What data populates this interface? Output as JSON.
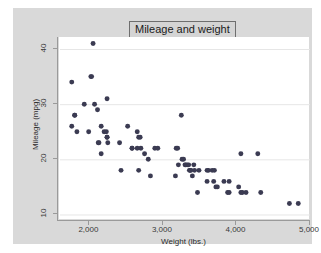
{
  "graph": {
    "title": "Mileage and weight",
    "colors": {
      "graph_region_bg": "#d9d9d9",
      "plot_bg": "#ffffff",
      "marker": "#3b3b52",
      "gridline": "#e6e6e6",
      "axis": "#9a9a9a",
      "title_box_bg": "#d4d4d4",
      "title_box_border": "#6e6e6e"
    }
  },
  "chart_data": {
    "type": "scatter",
    "title": "Mileage and weight",
    "xlabel": "Weight (lbs.)",
    "ylabel": "Mileage (mpg)",
    "xlim": [
      1600,
      5000
    ],
    "ylim": [
      9,
      42
    ],
    "xticks": [
      2000,
      3000,
      4000,
      5000
    ],
    "xticklabels": [
      "2,000",
      "3,000",
      "4,000",
      "5,000"
    ],
    "yticks": [
      10,
      20,
      30,
      40
    ],
    "yticklabels": [
      "10",
      "20",
      "30",
      "40"
    ],
    "grid": "horizontal",
    "legend": null,
    "marker": "circle",
    "marker_size": 3,
    "series": [
      {
        "name": "cars",
        "x": [
          2050,
          1760,
          2020,
          2030,
          1930,
          2240,
          2110,
          1800,
          1800,
          1760,
          1830,
          1990,
          2070,
          2160,
          2200,
          2230,
          2240,
          2250,
          2410,
          2520,
          2580,
          2650,
          2670,
          2690,
          2700,
          2120,
          2130,
          2160,
          2240,
          2430,
          2580,
          2650,
          2670,
          2750,
          2800,
          2830,
          2890,
          2930,
          3170,
          3180,
          3200,
          3210,
          3250,
          3260,
          3280,
          3300,
          3310,
          3330,
          3350,
          3360,
          3370,
          3380,
          3400,
          3420,
          3430,
          3470,
          3490,
          3600,
          3600,
          3620,
          3670,
          3690,
          3700,
          3720,
          3740,
          3830,
          3880,
          3900,
          3900,
          4030,
          4060,
          4060,
          4080,
          4130,
          4290,
          4330,
          4720,
          4840
        ],
        "y": [
          41,
          34,
          35,
          35,
          30,
          31,
          29,
          28,
          28,
          26,
          25,
          25,
          30,
          26,
          25,
          25,
          24,
          23,
          23,
          26,
          22,
          25,
          24,
          24,
          22,
          23,
          23,
          21,
          24,
          18,
          22,
          22,
          18,
          21,
          20,
          17,
          22,
          22,
          17,
          22,
          22,
          19,
          28,
          20,
          20,
          19,
          19,
          19,
          19,
          18,
          18,
          18,
          17,
          19,
          18,
          14,
          18,
          18,
          16,
          18,
          18,
          16,
          18,
          15,
          15,
          16,
          14,
          14,
          16,
          15,
          21,
          14,
          14,
          14,
          21,
          14,
          12,
          12
        ]
      }
    ]
  },
  "axes": {
    "x": {
      "title": "Weight (lbs.)",
      "ticks": [
        {
          "value": 2000,
          "label": "2,000"
        },
        {
          "value": 3000,
          "label": "3,000"
        },
        {
          "value": 4000,
          "label": "4,000"
        },
        {
          "value": 5000,
          "label": "5,000"
        }
      ]
    },
    "y": {
      "title": "Mileage (mpg)",
      "ticks": [
        {
          "value": 10,
          "label": "10"
        },
        {
          "value": 20,
          "label": "20"
        },
        {
          "value": 30,
          "label": "30"
        },
        {
          "value": 40,
          "label": "40"
        }
      ]
    }
  }
}
